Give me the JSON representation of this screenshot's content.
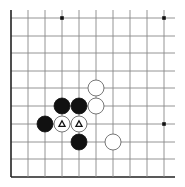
{
  "diagram": {
    "type": "go-board-fragment",
    "corner": "bottom-left",
    "grid": {
      "x_lines": [
        11,
        28,
        45,
        62,
        79,
        96,
        113,
        130,
        147,
        164
      ],
      "y_lines": [
        18,
        36,
        53,
        71,
        88,
        106,
        124,
        142,
        159,
        177
      ],
      "x_extent": [
        11,
        175
      ],
      "y_extent": [
        10,
        177
      ],
      "line_color": "#888888",
      "edge_color": "#222222"
    },
    "star_points": [
      {
        "col": 3,
        "row": 0
      },
      {
        "col": 9,
        "row": 0
      },
      {
        "col": 9,
        "row": 6
      }
    ],
    "stones": [
      {
        "color": "white",
        "col": 5,
        "row": 4,
        "marker": ""
      },
      {
        "color": "white",
        "col": 5,
        "row": 5,
        "marker": ""
      },
      {
        "color": "black",
        "col": 3,
        "row": 5,
        "marker": ""
      },
      {
        "color": "black",
        "col": 4,
        "row": 5,
        "marker": ""
      },
      {
        "color": "black",
        "col": 2,
        "row": 6,
        "marker": ""
      },
      {
        "color": "white",
        "col": 3,
        "row": 6,
        "marker": "triangle"
      },
      {
        "color": "white",
        "col": 4,
        "row": 6,
        "marker": "triangle"
      },
      {
        "color": "black",
        "col": 4,
        "row": 7,
        "marker": ""
      },
      {
        "color": "white",
        "col": 6,
        "row": 7,
        "marker": ""
      }
    ],
    "stone_radius": 8,
    "colors": {
      "black": "#111111",
      "white": "#ffffff",
      "stone_outline": "#555555"
    }
  }
}
